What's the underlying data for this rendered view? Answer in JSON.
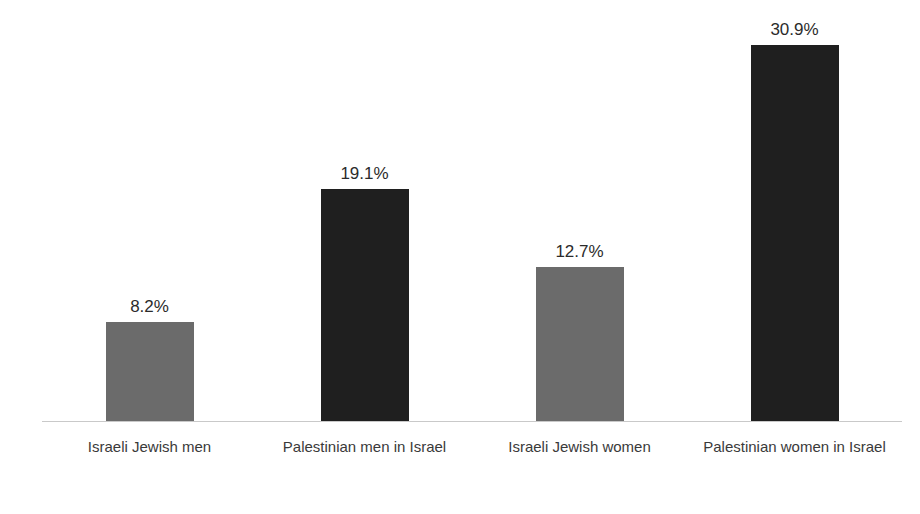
{
  "chart_data": {
    "type": "bar",
    "title": "",
    "subtitle": "",
    "xlabel": "",
    "ylabel": "Depression scores",
    "categories": [
      "Israeli Jewish men",
      "Palestinian men in Israel",
      "Israeli Jewish women",
      "Palestinian women in Israel"
    ],
    "values": [
      8.2,
      19.1,
      12.7,
      30.9
    ],
    "value_labels": [
      "8.2%",
      "19.1%",
      "12.7%",
      "30.9%"
    ],
    "unit": "%",
    "ylim": [
      0,
      34.5
    ],
    "grid": false,
    "legend": "none",
    "axis_line_color": "#c9c9c9",
    "bar_colors": [
      "#6b6b6b",
      "#1f1f1f",
      "#6b6b6b",
      "#1f1f1f"
    ],
    "series": [
      {
        "name": "Depression scores",
        "values": [
          8.2,
          19.1,
          12.7,
          30.9
        ]
      }
    ],
    "bars": [
      {
        "category": "Israeli Jewish men",
        "value": 8.2,
        "label": "8.2%",
        "color": "#6b6b6b"
      },
      {
        "category": "Palestinian men in Israel",
        "value": 19.1,
        "label": "19.1%",
        "color": "#1f1f1f"
      },
      {
        "category": "Israeli Jewish women",
        "value": 12.7,
        "label": "12.7%",
        "color": "#6b6b6b"
      },
      {
        "category": "Palestinian women in Israel",
        "value": 30.9,
        "label": "30.9%",
        "color": "#1f1f1f"
      }
    ]
  }
}
